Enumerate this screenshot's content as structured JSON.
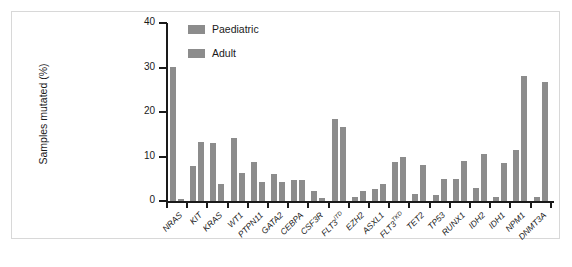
{
  "chart_data": {
    "type": "bar",
    "title": "",
    "xlabel": "",
    "ylabel": "Samples mutated (%)",
    "ylim": [
      0,
      40
    ],
    "yticks": [
      0,
      10,
      20,
      30,
      40
    ],
    "ytick_labels": [
      "0",
      "10",
      "20",
      "30",
      "40"
    ],
    "grid": false,
    "legend_position": "top-left-inside",
    "categories": [
      "NRAS",
      "KIT",
      "KRAS",
      "WT1",
      "PTPN11",
      "GATA2",
      "CEBPA",
      "CSF3R",
      "FLT3ITD",
      "EZH2",
      "ASXL1",
      "FLT3TKD",
      "TET2",
      "TP53",
      "RUNX1",
      "IDH2",
      "IDH1",
      "NPM1",
      "DNMT3A"
    ],
    "category_labels": [
      {
        "base": "NRAS",
        "sup": ""
      },
      {
        "base": "KIT",
        "sup": ""
      },
      {
        "base": "KRAS",
        "sup": ""
      },
      {
        "base": "WT1",
        "sup": ""
      },
      {
        "base": "PTPN11",
        "sup": ""
      },
      {
        "base": "GATA2",
        "sup": ""
      },
      {
        "base": "CEBPA",
        "sup": ""
      },
      {
        "base": "CSF3R",
        "sup": ""
      },
      {
        "base": "FLT3",
        "sup": "ITD"
      },
      {
        "base": "EZH2",
        "sup": ""
      },
      {
        "base": "ASXL1",
        "sup": ""
      },
      {
        "base": "FLT3",
        "sup": "TKD"
      },
      {
        "base": "TET2",
        "sup": ""
      },
      {
        "base": "TP53",
        "sup": ""
      },
      {
        "base": "RUNX1",
        "sup": ""
      },
      {
        "base": "IDH2",
        "sup": ""
      },
      {
        "base": "IDH1",
        "sup": ""
      },
      {
        "base": "NPM1",
        "sup": ""
      },
      {
        "base": "DNMT3A",
        "sup": ""
      }
    ],
    "series": [
      {
        "name": "Paediatric",
        "color": "#8c8c8c",
        "values": [
          30.2,
          7.8,
          13.0,
          14.2,
          8.8,
          6.0,
          4.8,
          2.2,
          18.5,
          1.0,
          2.8,
          8.8,
          1.5,
          1.3,
          5.0,
          3.0,
          1.0,
          11.5,
          1.0
        ]
      },
      {
        "name": "Adult",
        "color": "#8c8c8c",
        "values": [
          0.5,
          13.2,
          3.8,
          6.2,
          4.2,
          4.3,
          4.8,
          0.6,
          16.7,
          2.2,
          3.8,
          10.0,
          8.0,
          5.0,
          9.0,
          10.5,
          8.5,
          28.0,
          26.7
        ]
      }
    ]
  },
  "legend": {
    "items": [
      {
        "label": "Paediatric",
        "color": "#8c8c8c"
      },
      {
        "label": "Adult",
        "color": "#8c8c8c"
      }
    ]
  },
  "axis": {
    "y_title": "Samples mutated (%)"
  }
}
